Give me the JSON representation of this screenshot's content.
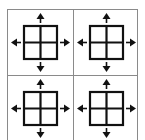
{
  "diagram": {
    "colors": {
      "frame": "#8a8a8a",
      "icon": "#111111",
      "background": "#ffffff"
    },
    "panels": [
      {
        "id": "top-left",
        "icon": "grid-2x2-icon",
        "arrows": [
          "up",
          "down",
          "left",
          "right"
        ]
      },
      {
        "id": "top-right",
        "icon": "grid-2x2-icon",
        "arrows": [
          "up",
          "down",
          "left",
          "right"
        ]
      },
      {
        "id": "bottom-left",
        "icon": "grid-2x2-icon",
        "arrows": [
          "up",
          "down",
          "left",
          "right"
        ]
      },
      {
        "id": "bottom-right",
        "icon": "grid-2x2-icon",
        "arrows": [
          "up",
          "down",
          "left",
          "right"
        ]
      }
    ]
  }
}
